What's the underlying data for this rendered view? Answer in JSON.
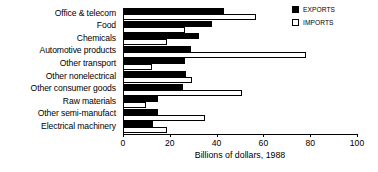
{
  "chart_data": {
    "type": "bar",
    "orientation": "horizontal",
    "title": "",
    "xlabel": "Billions of dollars, 1988",
    "ylabel": "",
    "xlim": [
      0,
      100
    ],
    "xticks": [
      0,
      20,
      40,
      60,
      80,
      100
    ],
    "grid": false,
    "legend_position": "top-right",
    "categories": [
      "Office & telecom",
      "Food",
      "Chemicals",
      "Automotive products",
      "Other transport",
      "Other nonelectrical",
      "Other consumer goods",
      "Raw materials",
      "Other semi-manufact",
      "Electrical machinery"
    ],
    "series": [
      {
        "name": "EXPORTS",
        "color": "#000000",
        "values": [
          43,
          38,
          32.5,
          29,
          26.5,
          27,
          25.5,
          15,
          15,
          13
        ]
      },
      {
        "name": "IMPORTS",
        "color": "#ffffff",
        "values": [
          57,
          26.5,
          19,
          78,
          12.5,
          29.5,
          51,
          10,
          35,
          19
        ]
      }
    ]
  },
  "axis": {
    "tick_labels": [
      "0",
      "20",
      "40",
      "60",
      "80",
      "100"
    ],
    "title": "Billions of dollars, 1988"
  },
  "legend": {
    "items": [
      {
        "label": "EXPORTS",
        "swatch": "filled-square-icon"
      },
      {
        "label": "IMPORTS",
        "swatch": "hollow-square-icon"
      }
    ]
  }
}
